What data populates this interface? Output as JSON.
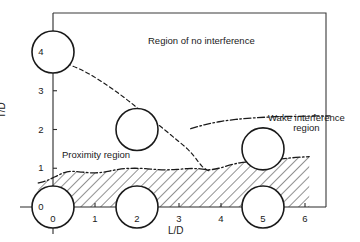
{
  "chart_data": {
    "type": "scatter",
    "title": "",
    "xlabel": "L/D",
    "ylabel": "T/D",
    "xlim": [
      -0.35,
      6.6
    ],
    "ylim": [
      -0.55,
      4.75
    ],
    "grid": false,
    "legend": null,
    "x_ticks": [
      "0",
      "1",
      "2",
      "3",
      "4",
      "5",
      "6"
    ],
    "x_tick_values": [
      0,
      1,
      2,
      3,
      4,
      5,
      6
    ],
    "y_ticks": [
      "0",
      "1",
      "2",
      "3",
      "4"
    ],
    "y_tick_values": [
      0,
      1,
      2,
      3,
      4
    ],
    "annotations": [
      {
        "name": "region-no-interference",
        "text": "Region of no interference",
        "x": 3.4,
        "y": 4.1
      },
      {
        "name": "region-proximity",
        "text": "Proximity region",
        "x": 0.6,
        "y": 1.45
      },
      {
        "name": "region-wake-interference-line1",
        "text": "Wake interference",
        "x": 5.4,
        "y": 2.15
      },
      {
        "name": "region-wake-interference-line2",
        "text": "region",
        "x": 5.4,
        "y": 1.85
      }
    ],
    "series": [
      {
        "name": "proximity-boundary-dashed",
        "style": "dashed",
        "points": [
          [
            0.0,
            3.78
          ],
          [
            0.25,
            3.72
          ],
          [
            0.55,
            3.6
          ],
          [
            0.85,
            3.44
          ],
          [
            1.15,
            3.24
          ],
          [
            1.45,
            3.02
          ],
          [
            1.75,
            2.78
          ],
          [
            2.05,
            2.52
          ],
          [
            2.35,
            2.26
          ],
          [
            2.65,
            2.0
          ],
          [
            2.95,
            1.73
          ],
          [
            3.2,
            1.5
          ],
          [
            3.35,
            1.32
          ],
          [
            3.45,
            1.18
          ],
          [
            3.55,
            1.05
          ],
          [
            3.65,
            0.97
          ],
          [
            3.72,
            0.93
          ]
        ]
      },
      {
        "name": "wake-interference-boundary-dashdot",
        "style": "dashdot",
        "points": [
          [
            3.28,
            2.02
          ],
          [
            3.6,
            2.12
          ],
          [
            3.95,
            2.2
          ],
          [
            4.35,
            2.26
          ],
          [
            4.8,
            2.3
          ],
          [
            5.3,
            2.33
          ],
          [
            5.8,
            2.34
          ],
          [
            6.25,
            2.35
          ],
          [
            6.6,
            2.35
          ]
        ]
      },
      {
        "name": "hatched-region-top-boundary-dashdot",
        "style": "dashdot",
        "points": [
          [
            -0.35,
            0.62
          ],
          [
            -0.15,
            0.68
          ],
          [
            0.05,
            0.78
          ],
          [
            0.25,
            0.88
          ],
          [
            0.45,
            0.92
          ],
          [
            0.7,
            0.9
          ],
          [
            0.95,
            0.88
          ],
          [
            1.2,
            0.9
          ],
          [
            1.45,
            0.95
          ],
          [
            1.7,
            0.99
          ],
          [
            1.95,
            1.0
          ],
          [
            2.2,
            0.99
          ],
          [
            2.45,
            0.97
          ],
          [
            2.7,
            0.96
          ],
          [
            2.95,
            0.97
          ],
          [
            3.2,
            0.99
          ],
          [
            3.45,
            0.99
          ],
          [
            3.7,
            0.96
          ],
          [
            3.95,
            1.0
          ],
          [
            4.2,
            1.08
          ],
          [
            4.45,
            1.14
          ],
          [
            4.7,
            1.17
          ],
          [
            4.95,
            1.18
          ],
          [
            5.2,
            1.2
          ],
          [
            5.45,
            1.24
          ],
          [
            5.7,
            1.27
          ],
          [
            5.95,
            1.29
          ],
          [
            6.1,
            1.3
          ]
        ]
      }
    ],
    "cylinders": [
      {
        "name": "cylinder-origin",
        "x": 0.0,
        "y": 0.0,
        "r_px": 21
      },
      {
        "name": "cylinder-ld2-td0",
        "x": 2.0,
        "y": 0.0,
        "r_px": 21
      },
      {
        "name": "cylinder-ld5-td0",
        "x": 5.0,
        "y": 0.0,
        "r_px": 21
      },
      {
        "name": "cylinder-ld0-td4",
        "x": 0.0,
        "y": 4.0,
        "r_px": 21
      },
      {
        "name": "cylinder-ld2-td2",
        "x": 2.0,
        "y": 2.0,
        "r_px": 21
      },
      {
        "name": "cylinder-ld5-td15",
        "x": 5.0,
        "y": 1.5,
        "r_px": 21
      }
    ],
    "colors": {
      "axis": "#1a1a1a",
      "text": "#1a1a1a",
      "hatch": "#1a1a1a",
      "background": "#ffffff"
    }
  }
}
